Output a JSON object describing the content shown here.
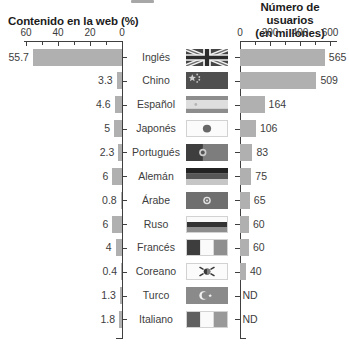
{
  "figure": {
    "left_chart": {
      "title": "Contenido en la web (%)",
      "axis_tick_labels": [
        "60",
        "40",
        "20",
        "0"
      ],
      "axis_max": 60
    },
    "right_chart": {
      "title_line1": "Número de usuarios",
      "title_line2": "(en millones)",
      "axis_tick_labels": [
        "0",
        "200",
        "400",
        "600"
      ],
      "axis_max": 600,
      "no_data_label": "ND"
    },
    "rows": [
      {
        "language": "Inglés",
        "flag": "uk",
        "web_value": 55.7,
        "web_label": "55.7",
        "users_value": 565,
        "users_label": "565"
      },
      {
        "language": "Chino",
        "flag": "china",
        "web_value": 3.3,
        "web_label": "3.3",
        "users_value": 509,
        "users_label": "509"
      },
      {
        "language": "Español",
        "flag": "spain",
        "web_value": 4.6,
        "web_label": "4.6",
        "users_value": 164,
        "users_label": "164"
      },
      {
        "language": "Japonés",
        "flag": "japan",
        "web_value": 5,
        "web_label": "5",
        "users_value": 106,
        "users_label": "106"
      },
      {
        "language": "Portugués",
        "flag": "portugal",
        "web_value": 2.3,
        "web_label": "2.3",
        "users_value": 83,
        "users_label": "83"
      },
      {
        "language": "Alemán",
        "flag": "germany",
        "web_value": 6,
        "web_label": "6",
        "users_value": 75,
        "users_label": "75"
      },
      {
        "language": "Árabe",
        "flag": "arab-league",
        "web_value": 0.8,
        "web_label": "0.8",
        "users_value": 65,
        "users_label": "65"
      },
      {
        "language": "Ruso",
        "flag": "russia",
        "web_value": 6,
        "web_label": "6",
        "users_value": 60,
        "users_label": "60"
      },
      {
        "language": "Francés",
        "flag": "france",
        "web_value": 4,
        "web_label": "4",
        "users_value": 60,
        "users_label": "60"
      },
      {
        "language": "Coreano",
        "flag": "south-korea",
        "web_value": 0.4,
        "web_label": "0.4",
        "users_value": 40,
        "users_label": "40"
      },
      {
        "language": "Turco",
        "flag": "turkey",
        "web_value": 1.3,
        "web_label": "1.3",
        "users_value": null,
        "users_label": "ND"
      },
      {
        "language": "Italiano",
        "flag": "italy",
        "web_value": 1.8,
        "web_label": "1.8",
        "users_value": null,
        "users_label": "ND"
      }
    ],
    "colors": {
      "bar": "#b0b0b0",
      "axis": "#3f3f3f",
      "text": "#3d3d3d"
    }
  },
  "chart_data": [
    {
      "type": "bar",
      "orientation": "horizontal",
      "direction": "right-to-left",
      "title": "Contenido en la web (%)",
      "categories": [
        "Inglés",
        "Chino",
        "Español",
        "Japonés",
        "Portugués",
        "Alemán",
        "Árabe",
        "Ruso",
        "Francés",
        "Coreano",
        "Turco",
        "Italiano"
      ],
      "values": [
        55.7,
        3.3,
        4.6,
        5,
        2.3,
        6,
        0.8,
        6,
        4,
        0.4,
        1.3,
        1.8
      ],
      "xlabel": "Contenido en la web (%)",
      "ylabel": "",
      "xlim": [
        60,
        0
      ],
      "ticks": [
        60,
        40,
        20,
        0
      ],
      "grid": false,
      "bar_color": "#b0b0b0"
    },
    {
      "type": "bar",
      "orientation": "horizontal",
      "direction": "left-to-right",
      "title": "Número de usuarios (en millones)",
      "categories": [
        "Inglés",
        "Chino",
        "Español",
        "Japonés",
        "Portugués",
        "Alemán",
        "Árabe",
        "Ruso",
        "Francés",
        "Coreano",
        "Turco",
        "Italiano"
      ],
      "values": [
        565,
        509,
        164,
        106,
        83,
        75,
        65,
        60,
        60,
        40,
        null,
        null
      ],
      "value_labels": [
        "565",
        "509",
        "164",
        "106",
        "83",
        "75",
        "65",
        "60",
        "60",
        "40",
        "ND",
        "ND"
      ],
      "xlabel": "Número de usuarios (en millones)",
      "ylabel": "",
      "xlim": [
        0,
        600
      ],
      "ticks": [
        0,
        200,
        400,
        600
      ],
      "grid": false,
      "bar_color": "#b0b0b0"
    }
  ]
}
